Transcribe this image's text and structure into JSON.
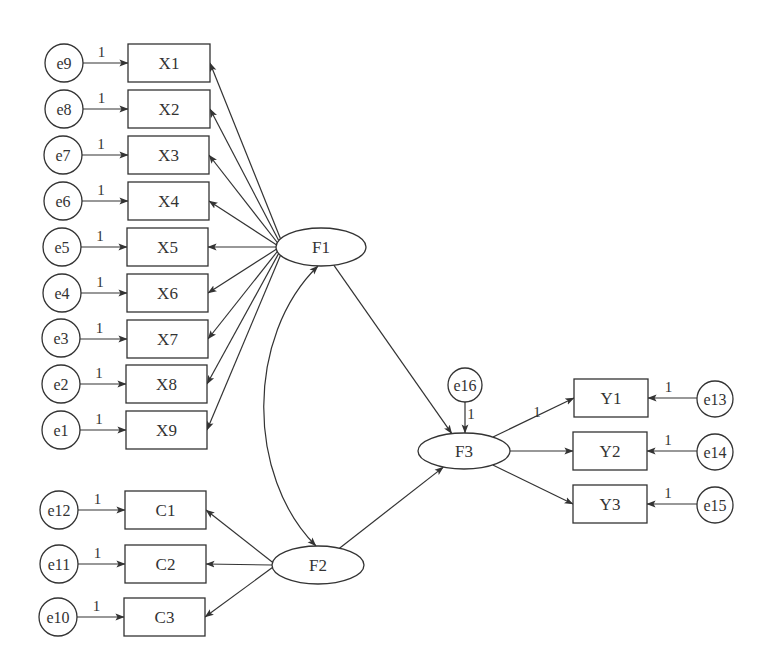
{
  "diagram": {
    "type": "structural-equation-model",
    "colors": {
      "stroke": "#333333",
      "background": "#ffffff",
      "text": "#333333"
    },
    "latent_factors": [
      {
        "id": "F1",
        "label": "F1",
        "cx": 321,
        "cy": 247,
        "rx": 45,
        "ry": 19
      },
      {
        "id": "F2",
        "label": "F2",
        "cx": 318,
        "cy": 565,
        "rx": 46,
        "ry": 19
      },
      {
        "id": "F3",
        "label": "F3",
        "cx": 464,
        "cy": 451,
        "rx": 46,
        "ry": 18
      }
    ],
    "observed_variables": [
      {
        "id": "X1",
        "label": "X1",
        "x": 128,
        "y": 44,
        "w": 82,
        "h": 38,
        "factor": "F1"
      },
      {
        "id": "X2",
        "label": "X2",
        "x": 128,
        "y": 90,
        "w": 82,
        "h": 38,
        "factor": "F1"
      },
      {
        "id": "X3",
        "label": "X3",
        "x": 128,
        "y": 136,
        "w": 81,
        "h": 38,
        "factor": "F1"
      },
      {
        "id": "X4",
        "label": "X4",
        "x": 128,
        "y": 182,
        "w": 81,
        "h": 38,
        "factor": "F1"
      },
      {
        "id": "X5",
        "label": "X5",
        "x": 127,
        "y": 228,
        "w": 81,
        "h": 38,
        "factor": "F1"
      },
      {
        "id": "X6",
        "label": "X6",
        "x": 127,
        "y": 274,
        "w": 81,
        "h": 38,
        "factor": "F1"
      },
      {
        "id": "X7",
        "label": "X7",
        "x": 127,
        "y": 320,
        "w": 81,
        "h": 38,
        "factor": "F1"
      },
      {
        "id": "X8",
        "label": "X8",
        "x": 126,
        "y": 365,
        "w": 81,
        "h": 38,
        "factor": "F1"
      },
      {
        "id": "X9",
        "label": "X9",
        "x": 126,
        "y": 411,
        "w": 81,
        "h": 38,
        "factor": "F1"
      },
      {
        "id": "C1",
        "label": "C1",
        "x": 125,
        "y": 491,
        "w": 81,
        "h": 38,
        "factor": "F2"
      },
      {
        "id": "C2",
        "label": "C2",
        "x": 125,
        "y": 545,
        "w": 81,
        "h": 38,
        "factor": "F2"
      },
      {
        "id": "C3",
        "label": "C3",
        "x": 124,
        "y": 598,
        "w": 81,
        "h": 38,
        "factor": "F2"
      },
      {
        "id": "Y1",
        "label": "Y1",
        "x": 574,
        "y": 379,
        "w": 74,
        "h": 38,
        "factor": "F3"
      },
      {
        "id": "Y2",
        "label": "Y2",
        "x": 573,
        "y": 432,
        "w": 74,
        "h": 38,
        "factor": "F3"
      },
      {
        "id": "Y3",
        "label": "Y3",
        "x": 573,
        "y": 485,
        "w": 74,
        "h": 38,
        "factor": "F3"
      }
    ],
    "error_terms": [
      {
        "id": "e9",
        "label": "e9",
        "cx": 64,
        "cy": 63,
        "r": 19,
        "target": "X1",
        "weight": "1"
      },
      {
        "id": "e8",
        "label": "e8",
        "cx": 64,
        "cy": 109,
        "r": 19,
        "target": "X2",
        "weight": "1"
      },
      {
        "id": "e7",
        "label": "e7",
        "cx": 63,
        "cy": 155,
        "r": 19,
        "target": "X3",
        "weight": "1"
      },
      {
        "id": "e6",
        "label": "e6",
        "cx": 63,
        "cy": 201,
        "r": 19,
        "target": "X4",
        "weight": "1"
      },
      {
        "id": "e5",
        "label": "e5",
        "cx": 62,
        "cy": 247,
        "r": 19,
        "target": "X5",
        "weight": "1"
      },
      {
        "id": "e4",
        "label": "e4",
        "cx": 62,
        "cy": 293,
        "r": 19,
        "target": "X6",
        "weight": "1"
      },
      {
        "id": "e3",
        "label": "e3",
        "cx": 61,
        "cy": 338,
        "r": 19,
        "target": "X7",
        "weight": "1"
      },
      {
        "id": "e2",
        "label": "e2",
        "cx": 61,
        "cy": 384,
        "r": 19,
        "target": "X8",
        "weight": "1"
      },
      {
        "id": "e1",
        "label": "e1",
        "cx": 61,
        "cy": 430,
        "r": 19,
        "target": "X9",
        "weight": "1"
      },
      {
        "id": "e12",
        "label": "e12",
        "cx": 59,
        "cy": 510,
        "r": 19,
        "target": "C1",
        "weight": "1"
      },
      {
        "id": "e11",
        "label": "e11",
        "cx": 59,
        "cy": 564,
        "r": 19,
        "target": "C2",
        "weight": "1"
      },
      {
        "id": "e10",
        "label": "e10",
        "cx": 58,
        "cy": 617,
        "r": 19,
        "target": "C3",
        "weight": "1"
      },
      {
        "id": "e13",
        "label": "e13",
        "cx": 715,
        "cy": 399,
        "r": 18,
        "target": "Y1",
        "weight": "1"
      },
      {
        "id": "e14",
        "label": "e14",
        "cx": 715,
        "cy": 452,
        "r": 18,
        "target": "Y2",
        "weight": "1"
      },
      {
        "id": "e15",
        "label": "e15",
        "cx": 715,
        "cy": 505,
        "r": 18,
        "target": "Y3",
        "weight": "1"
      },
      {
        "id": "e16",
        "label": "e16",
        "cx": 465,
        "cy": 385,
        "r": 17,
        "target": "F3",
        "weight": "1"
      }
    ],
    "structural_paths": [
      {
        "from": "F1",
        "to": "F3"
      },
      {
        "from": "F2",
        "to": "F3"
      }
    ],
    "covariances": [
      {
        "between": [
          "F1",
          "F2"
        ]
      }
    ],
    "fixed_loading_labels": [
      {
        "path": "F3->Y1",
        "label": "1",
        "x": 537,
        "y": 417
      }
    ]
  }
}
